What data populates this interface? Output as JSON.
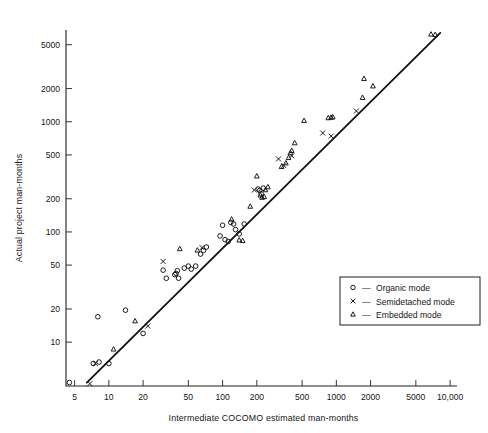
{
  "chart_data": {
    "type": "scatter",
    "title": "",
    "xlabel": "Intermediate COCOMO estimated man-months",
    "ylabel": "Actual project man-months",
    "xscale": "log",
    "yscale": "log",
    "xlim": [
      4.2,
      11500
    ],
    "ylim": [
      4.0,
      6800
    ],
    "grid": false,
    "xticks": [
      5,
      10,
      20,
      50,
      100,
      200,
      500,
      1000,
      2000,
      5000,
      10000
    ],
    "xticklabels": [
      "5",
      "10",
      "20",
      "50",
      "100",
      "200",
      "500",
      "1000",
      "2000",
      "5000",
      "10,000"
    ],
    "yticks": [
      10,
      20,
      50,
      100,
      200,
      500,
      1000,
      2000,
      5000
    ],
    "yticklabels": [
      "10",
      "20",
      "50",
      "100",
      "200",
      "500",
      "1000",
      "2000",
      "5000"
    ],
    "reference_line": {
      "name": "one-to-one estimate line",
      "x": [
        6.4,
        8200
      ],
      "y": [
        4.3,
        6400
      ]
    },
    "legend_position": "lower-right-inside",
    "series": [
      {
        "name": "Organic mode",
        "marker": "circle",
        "legend_label": "Organic mode",
        "points": [
          [
            4.5,
            4.3
          ],
          [
            7.3,
            6.4
          ],
          [
            8.2,
            6.6
          ],
          [
            10.0,
            6.4
          ],
          [
            8.0,
            17.0
          ],
          [
            14.0,
            19.5
          ],
          [
            20.0,
            12.0
          ],
          [
            30.0,
            45.0
          ],
          [
            32.0,
            38.0
          ],
          [
            38.0,
            41.0
          ],
          [
            39.0,
            42.0
          ],
          [
            40.0,
            44.5
          ],
          [
            41.0,
            38.0
          ],
          [
            46.0,
            47.0
          ],
          [
            50.0,
            49.0
          ],
          [
            53.0,
            46.0
          ],
          [
            58.0,
            49.0
          ],
          [
            64.0,
            63.0
          ],
          [
            68.0,
            68.0
          ],
          [
            72.0,
            73.0
          ],
          [
            95.0,
            92.0
          ],
          [
            100.0,
            115.0
          ],
          [
            105.0,
            85.0
          ],
          [
            112.0,
            82.0
          ],
          [
            118.0,
            122.0
          ],
          [
            125.0,
            118.0
          ],
          [
            130.0,
            105.0
          ],
          [
            140.0,
            96.0
          ],
          [
            155.0,
            118.0
          ],
          [
            205.0,
            245.0
          ],
          [
            212.0,
            238.0
          ],
          [
            218.0,
            222.0
          ],
          [
            228.0,
            250.0
          ]
        ]
      },
      {
        "name": "Semidetached mode",
        "marker": "x",
        "legend_label": "Semidetached mode",
        "points": [
          [
            6.8,
            4.2
          ],
          [
            7.6,
            6.4
          ],
          [
            22.0,
            14.0
          ],
          [
            30.0,
            54.0
          ],
          [
            66.0,
            72.0
          ],
          [
            190.0,
            240.0
          ],
          [
            310.0,
            460.0
          ],
          [
            345.0,
            400.0
          ],
          [
            405.0,
            490.0
          ],
          [
            760.0,
            790.0
          ],
          [
            900.0,
            740.0
          ],
          [
            1500.0,
            1250.0
          ]
        ]
      },
      {
        "name": "Embedded mode",
        "marker": "triangle",
        "legend_label": "Embedded mode",
        "points": [
          [
            11.0,
            8.6
          ],
          [
            17.0,
            15.5
          ],
          [
            42.0,
            70.0
          ],
          [
            60.0,
            68.0
          ],
          [
            120.0,
            130.0
          ],
          [
            140.0,
            84.0
          ],
          [
            150.0,
            83.0
          ],
          [
            175.0,
            170.0
          ],
          [
            200.0,
            320.0
          ],
          [
            215.0,
            215.0
          ],
          [
            222.0,
            205.0
          ],
          [
            232.0,
            208.0
          ],
          [
            238.0,
            240.0
          ],
          [
            250.0,
            255.0
          ],
          [
            330.0,
            390.0
          ],
          [
            360.0,
            420.0
          ],
          [
            380.0,
            470.0
          ],
          [
            395.0,
            520.0
          ],
          [
            405.0,
            545.0
          ],
          [
            430.0,
            640.0
          ],
          [
            520.0,
            1020.0
          ],
          [
            850.0,
            1080.0
          ],
          [
            900.0,
            1090.0
          ],
          [
            930.0,
            1100.0
          ],
          [
            1700.0,
            1650.0
          ],
          [
            1750.0,
            2450.0
          ],
          [
            2100.0,
            2100.0
          ],
          [
            6800.0,
            6200.0
          ],
          [
            7400.0,
            6150.0
          ]
        ]
      }
    ]
  },
  "axes": {
    "x_title": "Intermediate COCOMO estimated man-months",
    "y_title": "Actual project man-months"
  },
  "legend": {
    "entries": [
      {
        "glyph": "circle-marker",
        "dash": "—",
        "label": "Organic mode"
      },
      {
        "glyph": "x-marker",
        "dash": "—",
        "label": "Semidetached mode"
      },
      {
        "glyph": "triangle-marker",
        "dash": "—",
        "label": "Embedded mode"
      }
    ]
  },
  "colors": {
    "ink": "#111111",
    "background": "#ffffff"
  }
}
